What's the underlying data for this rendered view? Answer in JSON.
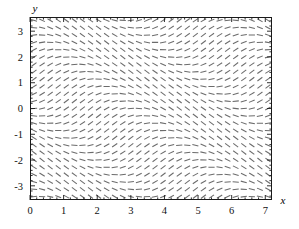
{
  "figure": {
    "kind": "direction-field",
    "background_color": "#ffffff",
    "frame_color": "#1a1a1a",
    "segment_color": "#6b6b6b"
  },
  "axes": {
    "x_label": "x",
    "y_label": "y",
    "x_ticks": [
      "0",
      "1",
      "2",
      "3",
      "4",
      "5",
      "6",
      "7"
    ],
    "y_ticks": [
      "3",
      "2",
      "1",
      "0",
      "-1",
      "-2",
      "-3"
    ]
  },
  "chart_data": {
    "type": "scatter",
    "subtype": "direction-field",
    "title": "",
    "xlabel": "x",
    "ylabel": "y",
    "xlim": [
      0,
      7.2
    ],
    "ylim": [
      -3.55,
      3.55
    ],
    "xticks": [
      0,
      1,
      2,
      3,
      4,
      5,
      6,
      7
    ],
    "yticks": [
      -3,
      -2,
      -1,
      0,
      1,
      2,
      3
    ],
    "xticklabels": [
      "0",
      "1",
      "2",
      "3",
      "4",
      "5",
      "6",
      "7"
    ],
    "yticklabels": [
      "-3",
      "-2",
      "-1",
      "0",
      "1",
      "2",
      "3"
    ],
    "grid": false,
    "legend": null,
    "minor_ticks": true,
    "slope_formula": "sin(x + y)",
    "segment_grid": {
      "nx": 30,
      "ny": 25,
      "x_start": 0.12,
      "x_end": 7.08,
      "y_start": -3.42,
      "y_end": 3.42,
      "segment_length_px": 6.2
    },
    "axis_geometry": {
      "left_px": 30,
      "right_px": 272,
      "top_px": 17,
      "bottom_px": 200
    }
  }
}
